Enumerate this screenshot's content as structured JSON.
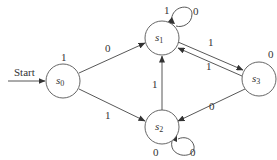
{
  "diagram": {
    "type": "finite-state-machine",
    "start_label": "Start",
    "states": [
      {
        "id": "s0",
        "name": "s",
        "sub": "0",
        "output": "1"
      },
      {
        "id": "s1",
        "name": "s",
        "sub": "1",
        "output": "1"
      },
      {
        "id": "s2",
        "name": "s",
        "sub": "2",
        "output": "0"
      },
      {
        "id": "s3",
        "name": "s",
        "sub": "3",
        "output": "0"
      }
    ],
    "transitions": [
      {
        "from": "s0",
        "to": "s1",
        "input": "0"
      },
      {
        "from": "s0",
        "to": "s2",
        "input": "1"
      },
      {
        "from": "s1",
        "to": "s1",
        "input": "0"
      },
      {
        "from": "s1",
        "to": "s3",
        "input": "1"
      },
      {
        "from": "s3",
        "to": "s1",
        "input": "1"
      },
      {
        "from": "s2",
        "to": "s1",
        "input": "1"
      },
      {
        "from": "s3",
        "to": "s2",
        "input": "0"
      },
      {
        "from": "s2",
        "to": "s2",
        "input": "0"
      }
    ]
  }
}
